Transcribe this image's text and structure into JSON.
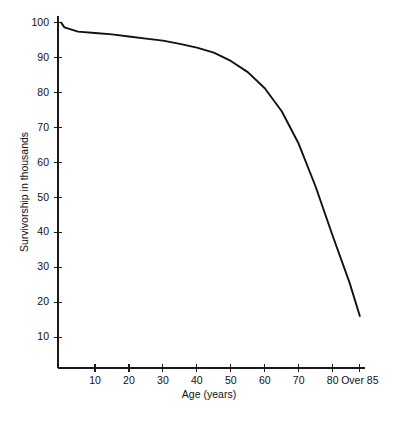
{
  "figure": {
    "background_color": "#ffffff",
    "line_color": "#111111",
    "axis_color": "#1a1a1a"
  },
  "chart_data": {
    "type": "line",
    "title": "",
    "subtitle": "",
    "xlabel": "Age (years)",
    "ylabel": "Survivorship in thousands",
    "xlim": [
      0,
      90
    ],
    "ylim": [
      0,
      103
    ],
    "grid": false,
    "legend": null,
    "legend_position": "none",
    "x_tick_labels": [
      "10",
      "20",
      "30",
      "40",
      "50",
      "60",
      "70",
      "80",
      "Over 85"
    ],
    "x_tick_values": [
      10,
      20,
      30,
      40,
      50,
      60,
      70,
      80,
      88
    ],
    "y_tick_labels": [
      "10",
      "20",
      "30",
      "40",
      "50",
      "60",
      "70",
      "80",
      "90",
      "100"
    ],
    "y_tick_values": [
      10,
      20,
      30,
      40,
      50,
      60,
      70,
      80,
      90,
      100
    ],
    "series": [
      {
        "name": "Survivorship",
        "x": [
          0,
          1,
          5,
          10,
          15,
          20,
          25,
          30,
          35,
          40,
          45,
          50,
          55,
          60,
          65,
          70,
          75,
          80,
          85,
          88
        ],
        "values": [
          100,
          98.6,
          97.4,
          97.0,
          96.6,
          96.0,
          95.4,
          94.8,
          93.9,
          92.8,
          91.4,
          89.0,
          85.8,
          81.2,
          74.6,
          65.3,
          53.0,
          39.0,
          25.5,
          16.0
        ]
      }
    ],
    "annotations": []
  }
}
